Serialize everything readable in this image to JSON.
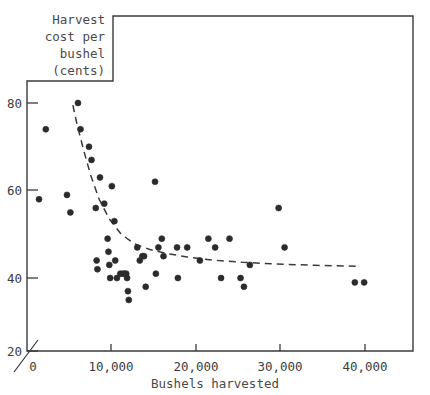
{
  "figure": {
    "caption_lines": [
      "Harvest",
      "cost per",
      "bushel",
      "(cents)"
    ],
    "xlabel": "Bushels harvested",
    "ink_color": "#2b2b2b",
    "text_color": "#4a4a4a",
    "frame_color": "#3a3a3a"
  },
  "chart_data": {
    "type": "scatter",
    "title": "Harvest cost per bushel (cents)",
    "xlabel": "Bushels harvested",
    "ylabel": "Harvest cost per bushel (cents)",
    "xlim": [
      0,
      45000
    ],
    "ylim": [
      20,
      85
    ],
    "grid": false,
    "legend": null,
    "xticks": [
      0,
      10000,
      20000,
      30000,
      40000
    ],
    "xticklabels": [
      "0",
      "10,000",
      "20,000",
      "30,000",
      "40,000"
    ],
    "yticks": [
      20,
      40,
      60,
      80
    ],
    "yticklabels": [
      "20",
      "40",
      "60",
      "80"
    ],
    "axis_break": true,
    "points": [
      [
        1500,
        58
      ],
      [
        2300,
        74
      ],
      [
        4800,
        59
      ],
      [
        5200,
        55
      ],
      [
        6100,
        80
      ],
      [
        6400,
        74
      ],
      [
        7400,
        70
      ],
      [
        7700,
        67
      ],
      [
        8200,
        56
      ],
      [
        8300,
        44
      ],
      [
        8400,
        42
      ],
      [
        8700,
        63
      ],
      [
        9200,
        57
      ],
      [
        9600,
        49
      ],
      [
        9700,
        46
      ],
      [
        9800,
        43
      ],
      [
        9900,
        40
      ],
      [
        10100,
        61
      ],
      [
        10400,
        53
      ],
      [
        10500,
        44
      ],
      [
        10700,
        40
      ],
      [
        11100,
        41
      ],
      [
        11400,
        41
      ],
      [
        11600,
        41
      ],
      [
        11800,
        41
      ],
      [
        11900,
        40
      ],
      [
        12000,
        37
      ],
      [
        12100,
        35
      ],
      [
        13100,
        47
      ],
      [
        13400,
        44
      ],
      [
        13700,
        45
      ],
      [
        13900,
        45
      ],
      [
        14100,
        38
      ],
      [
        15200,
        62
      ],
      [
        15300,
        41
      ],
      [
        15600,
        47
      ],
      [
        16000,
        49
      ],
      [
        16200,
        45
      ],
      [
        17800,
        47
      ],
      [
        17900,
        40
      ],
      [
        19000,
        47
      ],
      [
        20500,
        44
      ],
      [
        21500,
        49
      ],
      [
        22300,
        47
      ],
      [
        23000,
        40
      ],
      [
        24000,
        49
      ],
      [
        25300,
        40
      ],
      [
        25700,
        38
      ],
      [
        26400,
        43
      ],
      [
        29800,
        56
      ],
      [
        30500,
        47
      ],
      [
        38800,
        39
      ],
      [
        39900,
        39
      ]
    ],
    "trend_line": {
      "style": "dashed",
      "x": [
        5500,
        6000,
        6800,
        7600,
        8600,
        9800,
        11200,
        12800,
        14600,
        16600,
        19000,
        22000,
        25500,
        29500,
        34000,
        39000
      ],
      "y": [
        79.5,
        75.0,
        69.0,
        63.5,
        58.0,
        53.5,
        50.0,
        47.8,
        46.5,
        45.6,
        44.8,
        44.1,
        43.6,
        43.2,
        42.9,
        42.7
      ]
    }
  }
}
